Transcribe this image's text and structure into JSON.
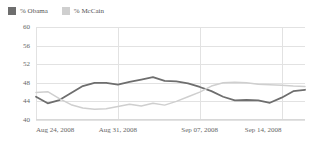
{
  "legend": {
    "position": "top-left",
    "entries": [
      {
        "label": "% Obama",
        "color": "#6e6e6e",
        "swatch": "legend-swatch-obama"
      },
      {
        "label": "% McCain",
        "color": "#cfcfcf",
        "swatch": "legend-swatch-mccain"
      }
    ]
  },
  "chart_data": {
    "type": "line",
    "title": "",
    "subtitle": "",
    "xlabel": "",
    "ylabel": "",
    "grid": true,
    "legend_position": "top-left",
    "ylim": [
      40,
      60
    ],
    "yticks": [
      60,
      56,
      52,
      48,
      44,
      40
    ],
    "xticks": [
      "Aug 24, 2008",
      "Aug 31, 2008",
      "Sep 07, 2008",
      "Sep 14, 2008"
    ],
    "xtick_positions": [
      0,
      7,
      14,
      21
    ],
    "xlim": [
      0,
      23
    ],
    "x": [
      0,
      1,
      2,
      3,
      4,
      5,
      6,
      7,
      8,
      9,
      10,
      11,
      12,
      13,
      14,
      15,
      16,
      17,
      18,
      19,
      20,
      21,
      22,
      23
    ],
    "series": [
      {
        "name": "% Obama",
        "color": "#6e6e6e",
        "width": 1.8,
        "values": [
          45.0,
          43.6,
          44.3,
          45.8,
          47.3,
          48.0,
          48.0,
          47.6,
          48.2,
          48.7,
          49.2,
          48.4,
          48.3,
          47.9,
          47.1,
          46.2,
          45.0,
          44.2,
          44.3,
          44.2,
          43.7,
          44.8,
          46.2,
          46.5
        ]
      },
      {
        "name": "% McCain",
        "color": "#cfcfcf",
        "width": 1.5,
        "values": [
          45.9,
          46.1,
          44.6,
          43.3,
          42.6,
          42.3,
          42.4,
          42.9,
          43.4,
          43.0,
          43.6,
          43.2,
          44.0,
          45.0,
          46.0,
          47.3,
          48.0,
          48.1,
          48.0,
          47.7,
          47.6,
          47.5,
          47.3,
          47.2
        ]
      }
    ]
  }
}
